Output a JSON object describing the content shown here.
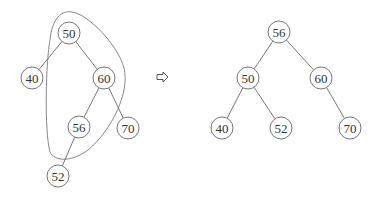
{
  "diagram": {
    "type": "binary-search-tree-rotation",
    "node_radius": 11,
    "before": {
      "nodes": [
        {
          "id": "b50",
          "label": "50",
          "x": 69,
          "y": 33
        },
        {
          "id": "b40",
          "label": "40",
          "x": 32,
          "y": 78
        },
        {
          "id": "b60",
          "label": "60",
          "x": 104,
          "y": 78
        },
        {
          "id": "b56",
          "label": "56",
          "x": 79,
          "y": 127
        },
        {
          "id": "b70",
          "label": "70",
          "x": 128,
          "y": 128
        },
        {
          "id": "b52",
          "label": "52",
          "x": 58,
          "y": 176
        }
      ],
      "edges": [
        [
          "b50",
          "b40"
        ],
        [
          "b50",
          "b60"
        ],
        [
          "b60",
          "b56"
        ],
        [
          "b60",
          "b70"
        ],
        [
          "b56",
          "b52"
        ]
      ],
      "highlight_outline": [
        "50",
        "60",
        "56"
      ]
    },
    "arrow": {
      "symbol": "⇨",
      "x": 162,
      "y": 77
    },
    "after": {
      "nodes": [
        {
          "id": "a56",
          "label": "56",
          "x": 279,
          "y": 32
        },
        {
          "id": "a50",
          "label": "50",
          "x": 248,
          "y": 78
        },
        {
          "id": "a60",
          "label": "60",
          "x": 321,
          "y": 78
        },
        {
          "id": "a40",
          "label": "40",
          "x": 222,
          "y": 128
        },
        {
          "id": "a52",
          "label": "52",
          "x": 281,
          "y": 128
        },
        {
          "id": "a70",
          "label": "70",
          "x": 350,
          "y": 128
        }
      ],
      "edges": [
        [
          "a56",
          "a50"
        ],
        [
          "a56",
          "a60"
        ],
        [
          "a50",
          "a40"
        ],
        [
          "a50",
          "a52"
        ],
        [
          "a60",
          "a70"
        ]
      ]
    }
  }
}
